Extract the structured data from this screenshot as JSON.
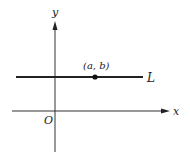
{
  "diagram": {
    "axes": {
      "x_label": "x",
      "y_label": "y",
      "origin_label": "O"
    },
    "line": {
      "label": "L",
      "description": "horizontal line"
    },
    "point": {
      "label": "(a, b)"
    },
    "colors": {
      "stroke": "#222222"
    }
  }
}
